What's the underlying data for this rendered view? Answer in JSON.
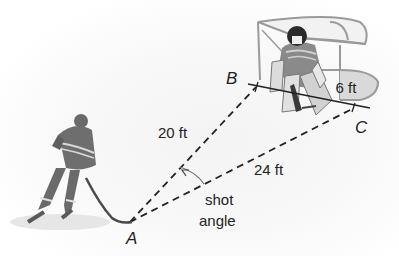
{
  "diagram": {
    "points": {
      "A": {
        "label": "A",
        "x": 130,
        "y": 222
      },
      "B": {
        "label": "B",
        "x": 248,
        "y": 84
      },
      "C": {
        "label": "C",
        "x": 368,
        "y": 108
      }
    },
    "segments": [
      {
        "from": "A",
        "to": "B",
        "label": "20 ft",
        "style": "dashed"
      },
      {
        "from": "A",
        "to": "C",
        "label": "24 ft",
        "style": "dashed"
      },
      {
        "from": "B",
        "to": "C",
        "label": "6 ft",
        "style": "solid",
        "note": "goal line / net mouth"
      }
    ],
    "angle": {
      "vertex": "A",
      "label_line1": "shot",
      "label_line2": "angle"
    },
    "figures": [
      {
        "name": "shooter",
        "description": "hockey player with stick at point A"
      },
      {
        "name": "goalie",
        "description": "goaltender in front of net"
      },
      {
        "name": "net",
        "description": "hockey goal net"
      }
    ],
    "colors": {
      "line": "#222222",
      "figure_dark": "#5a5a5a",
      "figure_mid": "#8a8a8a",
      "figure_light": "#cfcfcf",
      "net": "#9a9a9a"
    }
  }
}
